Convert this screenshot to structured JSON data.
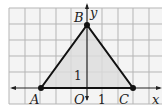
{
  "figure": {
    "type": "coordinate-plane-triangle",
    "grid": {
      "x_min": -5,
      "x_max": 5,
      "y_min": -1,
      "y_max": 5,
      "unit": 1
    },
    "axes": {
      "x_label": "x",
      "y_label": "y",
      "origin_label": "O",
      "x_tick_label": "1",
      "y_tick_label": "1"
    },
    "points": [
      {
        "name": "A",
        "x": -3,
        "y": 0
      },
      {
        "name": "B",
        "x": 0,
        "y": 4
      },
      {
        "name": "C",
        "x": 3,
        "y": 0
      }
    ],
    "colors": {
      "grid": "#b5b5b5",
      "fill": "#dcdcdc",
      "stroke": "#111111",
      "background": "#f4f4f4"
    }
  }
}
